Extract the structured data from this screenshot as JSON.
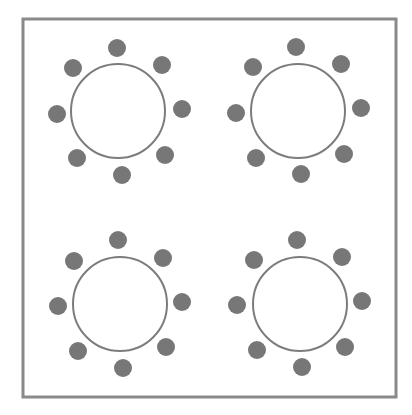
{
  "diagram": {
    "title": "",
    "colors": {
      "background": "#ffffff",
      "frame": "#8a8a8a",
      "table_stroke": "#7c7c7c",
      "table_fill": "#ffffff",
      "chair_fill": "#777777"
    },
    "frame": {
      "x": 23,
      "y": 19,
      "width": 373,
      "height": 378,
      "stroke_width": 3
    },
    "table_radius": 47,
    "chair_radius": 9,
    "tables": [
      {
        "id": "table-top-left",
        "center": [
          118,
          111
        ],
        "chairs": [
          [
            117,
            48
          ],
          [
            162,
            65
          ],
          [
            182,
            109
          ],
          [
            165,
            155
          ],
          [
            122,
            175
          ],
          [
            77,
            158
          ],
          [
            57,
            114
          ],
          [
            73,
            68
          ]
        ]
      },
      {
        "id": "table-top-right",
        "center": [
          298,
          111
        ],
        "chairs": [
          [
            296,
            47
          ],
          [
            341,
            64
          ],
          [
            361,
            108
          ],
          [
            344,
            154
          ],
          [
            301,
            174
          ],
          [
            256,
            158
          ],
          [
            236,
            113
          ],
          [
            253,
            67
          ]
        ]
      },
      {
        "id": "table-bottom-left",
        "center": [
          120,
          304
        ],
        "chairs": [
          [
            118,
            240
          ],
          [
            163,
            258
          ],
          [
            182,
            302
          ],
          [
            166,
            347
          ],
          [
            123,
            368
          ],
          [
            78,
            351
          ],
          [
            58,
            306
          ],
          [
            74,
            261
          ]
        ]
      },
      {
        "id": "table-bottom-right",
        "center": [
          300,
          304
        ],
        "chairs": [
          [
            297,
            240
          ],
          [
            342,
            257
          ],
          [
            362,
            301
          ],
          [
            345,
            347
          ],
          [
            302,
            367
          ],
          [
            257,
            350
          ],
          [
            237,
            305
          ],
          [
            254,
            260
          ]
        ]
      }
    ]
  }
}
